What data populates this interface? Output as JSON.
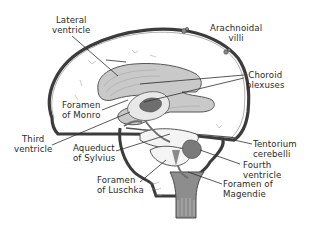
{
  "diagram": {
    "type": "anatomical-illustration",
    "colors": {
      "background": "#ffffff",
      "outline": "#3c3c3c",
      "fill_dark": "#6e6e6e",
      "fill_mid": "#a9a9a9",
      "fill_light": "#d4d4d4",
      "label_text": "#2a2a2a"
    },
    "labels": [
      {
        "id": "lateral-ventricle",
        "lines": [
          "Lateral",
          "ventricle"
        ]
      },
      {
        "id": "arachnoidal-villi",
        "lines": [
          "Arachnoidal",
          "villi"
        ]
      },
      {
        "id": "choroid-plexuses",
        "lines": [
          "Choroid",
          "plexuses"
        ]
      },
      {
        "id": "foramen-of-monro",
        "lines": [
          "Foramen",
          "of Monro"
        ]
      },
      {
        "id": "third-ventricle",
        "lines": [
          "Third",
          "ventricle"
        ]
      },
      {
        "id": "aqueduct-of-sylvius",
        "lines": [
          "Aqueduct",
          "of Sylvius"
        ]
      },
      {
        "id": "foramen-of-luschka",
        "lines": [
          "Foramen",
          "of Luschka"
        ]
      },
      {
        "id": "tentorium-cerebelli",
        "lines": [
          "Tentorium",
          "cerebelli"
        ]
      },
      {
        "id": "fourth-ventricle",
        "lines": [
          "Fourth",
          "ventricle"
        ]
      },
      {
        "id": "foramen-of-magendie",
        "lines": [
          "Foramen of",
          "Magendie"
        ]
      }
    ]
  }
}
